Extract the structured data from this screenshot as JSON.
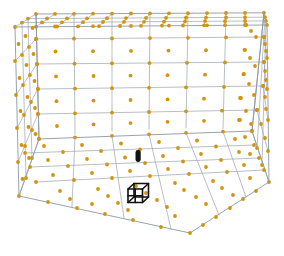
{
  "app": {
    "title": "3D Voxel Room Viewer",
    "background_color": "#ffffff"
  },
  "viewport": {
    "width": 284,
    "height": 256,
    "projection": "perspective",
    "camera_view_label": "isometric-interior"
  },
  "palette": {
    "grid_line_color": "#9aa3ae",
    "grid_edge_color": "#8e97a3",
    "node_color": "#d2930d",
    "node_halo_color": "#f3e2b4",
    "object_color": "#111111",
    "background_color": "#ffffff"
  },
  "room": {
    "name": "bounding-room",
    "surfaces": [
      "ceiling",
      "floor",
      "left-wall",
      "back-wall",
      "right-wall"
    ],
    "grid_divisions": {
      "width_cells": 6,
      "depth_cells": 4,
      "height_cells": 5
    },
    "corners_px": {
      "front_left_top": [
        15,
        27
      ],
      "front_left_bottom": [
        19,
        196
      ],
      "back_left_top": [
        36,
        14
      ],
      "back_left_bottom": [
        39,
        139
      ],
      "back_right_top": [
        250,
        22
      ],
      "back_right_bottom": [
        252,
        131
      ],
      "front_right_top": [
        267,
        25
      ],
      "front_right_bottom": [
        269,
        182
      ],
      "floor_front_center": [
        190,
        233
      ]
    }
  },
  "nodes": {
    "name": "navigation-node-cloud",
    "marker": "filled-circle",
    "radius_px": 1.9,
    "total_count": 212,
    "description": "orange waypoint markers at grid vertices and cell centers on every room surface"
  },
  "objects": [
    {
      "id": "target-cube",
      "name": "wireframe-cube-marker",
      "shape": "cube-wireframe",
      "color": "#111111",
      "position_px": [
        138,
        194
      ],
      "size_px": 21
    },
    {
      "id": "agent-capsule",
      "name": "agent-capsule-marker",
      "shape": "rounded-capsule",
      "color": "#111111",
      "position_px": [
        138,
        156
      ],
      "size_px": [
        5,
        12
      ]
    }
  ],
  "chart_data": {
    "type": "scatter",
    "title": "",
    "xlabel": "",
    "ylabel": "",
    "grid": true,
    "legend": null,
    "series": [
      {
        "name": "grid-nodes",
        "color": "#d2930d",
        "count": 212
      }
    ],
    "annotations": [
      {
        "label": "target-cube",
        "x": 138,
        "y": 194
      },
      {
        "label": "agent-capsule",
        "x": 138,
        "y": 156
      }
    ]
  }
}
